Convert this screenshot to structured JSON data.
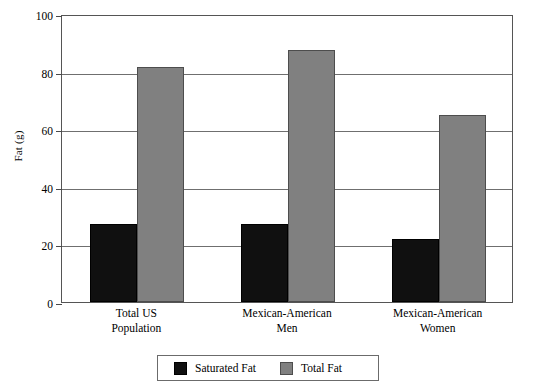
{
  "chart_data": {
    "type": "bar",
    "title": "",
    "subtitle": "",
    "xlabel": "",
    "ylabel": "Fat (g)",
    "ylim": [
      0,
      100
    ],
    "yticks": [
      0,
      20,
      40,
      60,
      80,
      100
    ],
    "ytick_labels": [
      "0",
      "20",
      "40",
      "60",
      "80",
      "100"
    ],
    "grid": true,
    "legend_position": "bottom-center",
    "categories": [
      "Total US Population",
      "Mexican-American Men",
      "Mexican-American Women"
    ],
    "category_lines": [
      [
        "Total US",
        "Population"
      ],
      [
        "Mexican-American",
        "Men"
      ],
      [
        "Mexican-American",
        "Women"
      ]
    ],
    "series": [
      {
        "name": "Saturated Fat",
        "color": "#101010",
        "values": [
          27,
          27,
          22
        ]
      },
      {
        "name": "Total Fat",
        "color": "#808080",
        "values": [
          81.5,
          87.5,
          65
        ]
      }
    ]
  },
  "axis": {
    "y_title": "Fat (g)"
  },
  "legend": {
    "items": [
      {
        "label": "Saturated Fat",
        "swatch": "black-square-swatch"
      },
      {
        "label": "Total Fat",
        "swatch": "gray-square-swatch"
      }
    ]
  },
  "colors": {
    "saturated_fat": "#101010",
    "total_fat": "#808080",
    "gridline": "#6f6f6f",
    "frame": "#555555",
    "background": "#ffffff"
  }
}
